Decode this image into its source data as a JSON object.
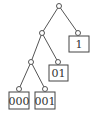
{
  "diagram": {
    "type": "binary-tree",
    "colors": {
      "edge": "#555555",
      "node_stroke": "#555555",
      "box_stroke": "#444444",
      "text": "#333333",
      "background": "#ffffff"
    },
    "nodes": [
      {
        "id": "root",
        "x": 59,
        "y": 6
      },
      {
        "id": "n0",
        "x": 42,
        "y": 33
      },
      {
        "id": "n1",
        "x": 78,
        "y": 33
      },
      {
        "id": "n00",
        "x": 31,
        "y": 62
      },
      {
        "id": "n01",
        "x": 58,
        "y": 62
      },
      {
        "id": "n000",
        "x": 19,
        "y": 89
      },
      {
        "id": "n001",
        "x": 45,
        "y": 89
      }
    ],
    "edges": [
      {
        "from": "root",
        "to": "n0"
      },
      {
        "from": "root",
        "to": "n1"
      },
      {
        "from": "n0",
        "to": "n00"
      },
      {
        "from": "n0",
        "to": "n01"
      },
      {
        "from": "n00",
        "to": "n000"
      },
      {
        "from": "n00",
        "to": "n001"
      }
    ],
    "leaves": [
      {
        "node": "n1",
        "label": "1",
        "box": {
          "x": 69,
          "y": 36,
          "w": 20,
          "h": 16
        }
      },
      {
        "node": "n01",
        "label": "01",
        "box": {
          "x": 49,
          "y": 65,
          "w": 19,
          "h": 16
        }
      },
      {
        "node": "n000",
        "label": "000",
        "box": {
          "x": 9,
          "y": 92,
          "w": 20,
          "h": 17
        }
      },
      {
        "node": "n001",
        "label": "001",
        "box": {
          "x": 35,
          "y": 92,
          "w": 20,
          "h": 17
        }
      }
    ]
  }
}
